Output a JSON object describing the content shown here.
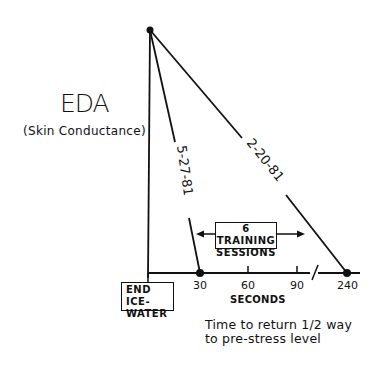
{
  "figure": {
    "y_axis_title": "EDA",
    "y_axis_subtitle": "(Skin Conductance)",
    "x_axis_label": "SECONDS",
    "x_ticks": [
      "30",
      "60",
      "90",
      "240"
    ],
    "start_box": {
      "line1": "END ICE-",
      "line2": "WATER"
    },
    "training_box": {
      "line1": "6 TRAINING",
      "line2": "SESSIONS"
    },
    "series": [
      {
        "label": "5-27-81",
        "recovery_seconds": 30
      },
      {
        "label": "2-20-81",
        "recovery_seconds": 240
      }
    ],
    "caption": {
      "line1": "Time to return 1/2 way",
      "line2": "to pre-stress level"
    },
    "axis_break": "//"
  }
}
